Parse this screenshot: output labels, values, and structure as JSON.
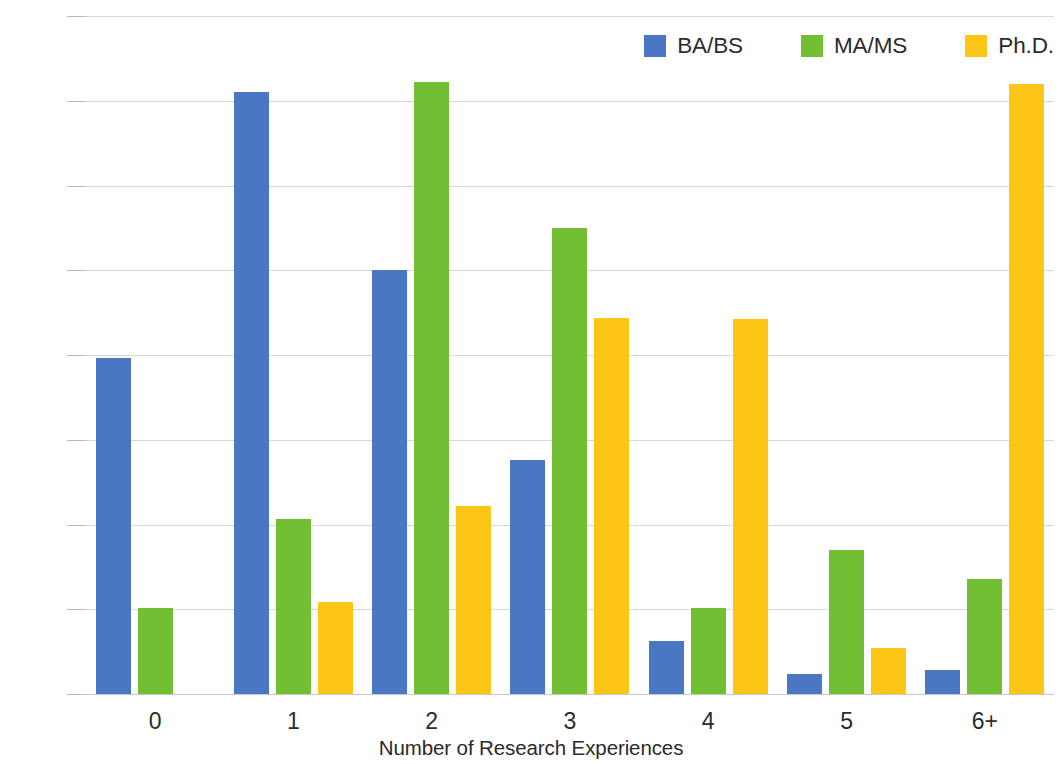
{
  "chart_data": {
    "type": "bar",
    "title": "",
    "subtitle": "",
    "xlabel": "Number of Research Experiences",
    "ylabel": "Percentage of Graduates",
    "categories": [
      "0",
      "1",
      "2",
      "3",
      "4",
      "5",
      "6+"
    ],
    "series": [
      {
        "name": "BA/BS",
        "color": "#4a77c4",
        "values": [
          19.8,
          35.5,
          25.0,
          13.8,
          3.1,
          1.2,
          1.4
        ]
      },
      {
        "name": "MA/MS",
        "color": "#72bf34",
        "values": [
          5.1,
          10.3,
          36.1,
          27.5,
          5.1,
          8.5,
          6.8
        ]
      },
      {
        "name": "Ph.D.",
        "color": "#fdc616",
        "values": [
          null,
          5.4,
          11.1,
          22.2,
          22.1,
          2.7,
          36.0
        ]
      }
    ],
    "ylim": [
      0,
      40
    ],
    "y_ticks": [
      "0%",
      "5%",
      "10%",
      "15%",
      "20%",
      "25%",
      "30%",
      "35%",
      "40%"
    ],
    "y_tick_values": [
      0,
      5,
      10,
      15,
      20,
      25,
      30,
      35,
      40
    ],
    "grid": true,
    "legend_position": "top-right",
    "value_suffix": "%"
  }
}
